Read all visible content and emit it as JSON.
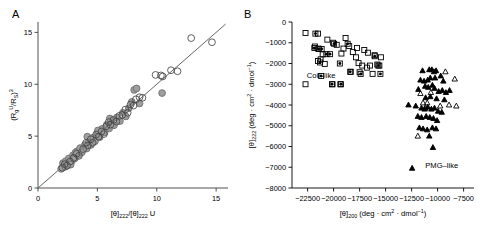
{
  "figure": {
    "panels": [
      {
        "letter": "A"
      },
      {
        "letter": "B"
      }
    ]
  },
  "chart_data": [
    {
      "panel": "A",
      "type": "scatter",
      "title": "",
      "xlabel": "[θ]222/[θ]222 U",
      "xlabel_parts": {
        "base1": "[θ]",
        "sub1": "222",
        "slash": "/",
        "base2": "[θ]",
        "sub2": "222",
        "tail": " U"
      },
      "ylabel": "(Rg U/RS)3",
      "ylabel_parts": {
        "open": "(R",
        "sub1": "g",
        "sup1": "U",
        "mid": "/R",
        "sub2": "S",
        "close": ")",
        "sup2": "3"
      },
      "xlim": [
        0,
        16
      ],
      "ylim": [
        0,
        16
      ],
      "xticks": [
        0,
        5,
        10,
        15
      ],
      "yticks": [
        0,
        5,
        10,
        15
      ],
      "grid": false,
      "legend": "none",
      "reference_line": {
        "type": "identity",
        "from": [
          0,
          0
        ],
        "to": [
          15.8,
          15.8
        ],
        "color": "#555555"
      },
      "series": [
        {
          "name": "open-circles",
          "marker": "open-circle",
          "fill": "none",
          "edge": "#444444",
          "points": [
            [
              2.05,
              1.95
            ],
            [
              2.25,
              2.3
            ],
            [
              2.45,
              2.15
            ],
            [
              2.7,
              2.55
            ],
            [
              3.0,
              2.9
            ],
            [
              3.25,
              3.3
            ],
            [
              3.45,
              3.1
            ],
            [
              3.8,
              3.75
            ],
            [
              4.05,
              4.35
            ],
            [
              4.2,
              4.1
            ],
            [
              4.45,
              4.7
            ],
            [
              4.6,
              4.35
            ],
            [
              4.9,
              5.15
            ],
            [
              5.1,
              4.95
            ],
            [
              5.35,
              5.45
            ],
            [
              5.55,
              5.2
            ],
            [
              5.75,
              5.95
            ],
            [
              5.95,
              6.35
            ],
            [
              6.1,
              6.1
            ],
            [
              6.35,
              6.55
            ],
            [
              6.6,
              6.4
            ],
            [
              6.85,
              6.95
            ],
            [
              7.1,
              7.05
            ],
            [
              7.35,
              7.55
            ],
            [
              7.55,
              7.25
            ],
            [
              7.8,
              8.05
            ],
            [
              8.05,
              7.95
            ],
            [
              8.25,
              8.55
            ],
            [
              8.55,
              8.75
            ],
            [
              8.8,
              8.7
            ],
            [
              9.9,
              10.9
            ],
            [
              10.35,
              10.85
            ],
            [
              10.5,
              10.75
            ],
            [
              11.2,
              11.35
            ],
            [
              11.75,
              11.25
            ],
            [
              12.9,
              14.45
            ],
            [
              14.65,
              14.05
            ]
          ]
        },
        {
          "name": "gray-filled-circles",
          "marker": "filled-circle",
          "fill": "#9e9e9e",
          "edge": "#6e6e6e",
          "points": [
            [
              1.95,
              1.85
            ],
            [
              2.1,
              2.4
            ],
            [
              2.3,
              2.05
            ],
            [
              2.35,
              2.6
            ],
            [
              2.55,
              2.35
            ],
            [
              2.6,
              2.85
            ],
            [
              2.85,
              2.6
            ],
            [
              2.95,
              3.15
            ],
            [
              3.1,
              2.85
            ],
            [
              3.3,
              3.55
            ],
            [
              3.4,
              3.2
            ],
            [
              3.55,
              3.85
            ],
            [
              3.7,
              3.45
            ],
            [
              3.95,
              4.15
            ],
            [
              4.1,
              3.8
            ],
            [
              4.3,
              4.5
            ],
            [
              4.45,
              4.15
            ],
            [
              4.65,
              4.85
            ],
            [
              4.8,
              4.5
            ],
            [
              5.0,
              5.3
            ],
            [
              5.2,
              4.9
            ],
            [
              5.4,
              5.7
            ],
            [
              5.6,
              5.35
            ],
            [
              5.8,
              6.1
            ],
            [
              6.0,
              5.75
            ],
            [
              6.2,
              6.45
            ],
            [
              6.4,
              6.05
            ],
            [
              6.65,
              6.8
            ],
            [
              6.9,
              6.45
            ],
            [
              7.15,
              7.25
            ],
            [
              7.4,
              6.9
            ],
            [
              7.65,
              7.7
            ],
            [
              7.9,
              8.3
            ],
            [
              8.1,
              9.45
            ],
            [
              8.3,
              9.6
            ],
            [
              8.55,
              8.15
            ],
            [
              10.45,
              9.15
            ],
            [
              4.15,
              4.95
            ],
            [
              5.05,
              5.55
            ],
            [
              6.05,
              6.7
            ],
            [
              3.15,
              3.4
            ],
            [
              2.75,
              2.25
            ]
          ]
        }
      ]
    },
    {
      "panel": "B",
      "type": "scatter",
      "title": "",
      "xlabel": "[θ]200 (deg · cm2 · dmol−1)",
      "xlabel_parts": {
        "base": "[θ]",
        "sub": "200",
        "unit_open": " (deg · cm",
        "sup1": "2",
        "unit_mid": " · dmol",
        "sup2": "−1",
        "unit_close": ")"
      },
      "ylabel": "[θ]222 (deg · cm2 · dmol−1)",
      "ylabel_parts": {
        "base": "[θ]",
        "sub": "222",
        "unit_open": " (deg · cm",
        "sup1": "2",
        "unit_mid": " · dmol",
        "sup2": "−1",
        "unit_close": ")"
      },
      "xlim": [
        -24000,
        -6500
      ],
      "ylim": [
        -8000,
        0
      ],
      "xticks": [
        -22500,
        -20000,
        -17500,
        -15000,
        -12500,
        -10000,
        -7500
      ],
      "yticks": [
        0,
        -1000,
        -2000,
        -3000,
        -4000,
        -5000,
        -6000,
        -7000,
        -8000
      ],
      "ytick_labels": [
        "0",
        "−1000",
        "−2000",
        "−3000",
        "−4000",
        "−5000",
        "−6000",
        "−7000",
        "−8000"
      ],
      "xtick_labels": [
        "−22500",
        "−20000",
        "−17500",
        "−15000",
        "−12500",
        "−10000",
        "−7500"
      ],
      "grid": false,
      "legend": "none",
      "annotations": [
        {
          "text": "Coil–like",
          "x": -21200,
          "y": -2700
        },
        {
          "text": "PMG–like",
          "x": -9600,
          "y": -7050
        }
      ],
      "series": [
        {
          "name": "open-squares",
          "marker": "open-square",
          "fill": "none",
          "edge": "#000000",
          "points": [
            [
              -22700,
              -530
            ],
            [
              -21500,
              -560
            ],
            [
              -21800,
              -1180
            ],
            [
              -21450,
              -1280
            ],
            [
              -21250,
              -1800
            ],
            [
              -21500,
              -1880
            ],
            [
              -21050,
              -1560
            ],
            [
              -20850,
              -2020
            ],
            [
              -20600,
              -850
            ],
            [
              -20050,
              -1000
            ],
            [
              -19700,
              -1100
            ],
            [
              -19250,
              -1520
            ],
            [
              -18850,
              -770
            ],
            [
              -18500,
              -1160
            ],
            [
              -18150,
              -1450
            ],
            [
              -17850,
              -1700
            ],
            [
              -17600,
              -1980
            ],
            [
              -17500,
              -2420
            ],
            [
              -17250,
              -2100
            ],
            [
              -17050,
              -1350
            ],
            [
              -16800,
              -2200
            ],
            [
              -16500,
              -2100
            ],
            [
              -16250,
              -2500
            ],
            [
              -16050,
              -1600
            ],
            [
              -15800,
              -2050
            ],
            [
              -15600,
              -2100
            ],
            [
              -15450,
              -1700
            ],
            [
              -22700,
              -3000
            ],
            [
              -20100,
              -3000
            ],
            [
              -19350,
              -3000
            ],
            [
              -18350,
              -2400
            ],
            [
              -17750,
              -1250
            ],
            [
              -16700,
              -1480
            ],
            [
              -19050,
              -1280
            ]
          ]
        },
        {
          "name": "dotted-squares",
          "marker": "dotted-square",
          "fill": "none",
          "edge": "#000000",
          "dot": "#000000",
          "points": [
            [
              -21750,
              -560
            ],
            [
              -21850,
              -1250
            ],
            [
              -21450,
              -1300
            ],
            [
              -21150,
              -1300
            ],
            [
              -21300,
              -1950
            ],
            [
              -20700,
              -1550
            ],
            [
              -20350,
              -1550
            ],
            [
              -19950,
              -1050
            ],
            [
              -18400,
              -2400
            ],
            [
              -17400,
              -2500
            ],
            [
              -18650,
              -1050
            ],
            [
              -16050,
              -1650
            ],
            [
              -15700,
              -2100
            ],
            [
              -15500,
              -2500
            ],
            [
              -21200,
              -2600
            ],
            [
              -20150,
              -3000
            ],
            [
              -19300,
              -3000
            ],
            [
              -19400,
              -2000
            ]
          ]
        },
        {
          "name": "filled-triangles",
          "marker": "filled-triangle",
          "fill": "#000000",
          "edge": "#000000",
          "points": [
            [
              -11450,
              -2350
            ],
            [
              -10800,
              -2300
            ],
            [
              -10550,
              -2300
            ],
            [
              -10350,
              -2400
            ],
            [
              -10150,
              -2350
            ],
            [
              -11650,
              -2800
            ],
            [
              -11300,
              -2850
            ],
            [
              -10950,
              -2800
            ],
            [
              -10700,
              -2700
            ],
            [
              -10250,
              -2700
            ],
            [
              -9700,
              -2600
            ],
            [
              -9450,
              -2850
            ],
            [
              -11850,
              -3250
            ],
            [
              -11200,
              -3100
            ],
            [
              -10900,
              -3150
            ],
            [
              -10500,
              -3050
            ],
            [
              -10300,
              -3200
            ],
            [
              -9900,
              -3350
            ],
            [
              -9550,
              -3300
            ],
            [
              -9200,
              -3400
            ],
            [
              -8850,
              -3300
            ],
            [
              -12800,
              -4000
            ],
            [
              -12100,
              -4050
            ],
            [
              -11550,
              -4150
            ],
            [
              -11250,
              -4200
            ],
            [
              -10950,
              -4100
            ],
            [
              -10600,
              -4200
            ],
            [
              -10300,
              -4150
            ],
            [
              -9950,
              -4300
            ],
            [
              -9600,
              -4350
            ],
            [
              -11900,
              -4550
            ],
            [
              -11550,
              -4600
            ],
            [
              -11100,
              -4550
            ],
            [
              -10750,
              -4600
            ],
            [
              -10400,
              -4650
            ],
            [
              -10050,
              -4750
            ],
            [
              -11750,
              -5100
            ],
            [
              -11400,
              -5150
            ],
            [
              -11000,
              -5200
            ],
            [
              -10500,
              -5100
            ],
            [
              -10150,
              -5150
            ],
            [
              -10800,
              -5500
            ],
            [
              -10450,
              -6050
            ],
            [
              -12450,
              -7050
            ],
            [
              -10700,
              -3600
            ],
            [
              -10100,
              -3700
            ],
            [
              -9350,
              -3750
            ],
            [
              -11150,
              -3650
            ]
          ]
        },
        {
          "name": "open-triangles",
          "marker": "open-triangle",
          "fill": "none",
          "edge": "#000000",
          "points": [
            [
              -9250,
              -2400
            ],
            [
              -8350,
              -2750
            ],
            [
              -11650,
              -3450
            ],
            [
              -10650,
              -3400
            ],
            [
              -11400,
              -3900
            ],
            [
              -11200,
              -4150
            ],
            [
              -8900,
              -4000
            ],
            [
              -8200,
              -4050
            ],
            [
              -11900,
              -5500
            ],
            [
              -9750,
              -4050
            ],
            [
              -11000,
              -3900
            ]
          ]
        }
      ]
    }
  ]
}
